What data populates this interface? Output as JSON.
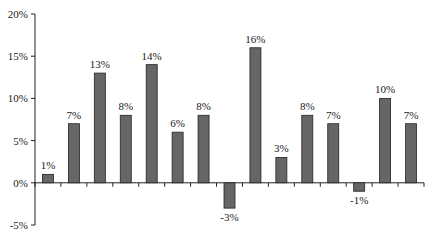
{
  "chart_data": {
    "type": "bar",
    "title": "",
    "xlabel": "",
    "ylabel": "",
    "categories": [
      "1",
      "2",
      "3",
      "4",
      "5",
      "6",
      "7",
      "8",
      "9",
      "10",
      "11",
      "12",
      "13",
      "14",
      "15"
    ],
    "values": [
      1,
      7,
      13,
      8,
      14,
      6,
      8,
      -3,
      16,
      3,
      8,
      7,
      -1,
      10,
      7
    ],
    "data_labels": [
      "1%",
      "7%",
      "13%",
      "8%",
      "14%",
      "6%",
      "8%",
      "-3%",
      "16%",
      "3%",
      "8%",
      "7%",
      "-1%",
      "10%",
      "7%"
    ],
    "ylim": [
      -5,
      20
    ],
    "yticks": [
      -5,
      0,
      5,
      10,
      15,
      20
    ],
    "ytick_labels": [
      "-5%",
      "0%",
      "5%",
      "10%",
      "15%",
      "20%"
    ],
    "grid": false,
    "legend": "none",
    "bar_color": "#666666",
    "bar_edge_color": "#222222"
  }
}
